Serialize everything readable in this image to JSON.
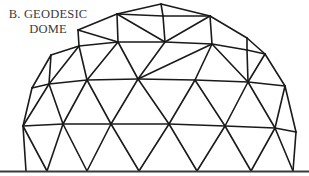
{
  "caption": {
    "line1": "B. GEODESIC",
    "line2": "DOME"
  },
  "diagram": {
    "subject": "geodesic dome",
    "stroke_color": "#1a1a1a",
    "ground_color": "#3a3a3a",
    "ground_y": 171,
    "nodes": {
      "T": [
        161,
        4
      ],
      "A1": [
        117,
        14
      ],
      "A2": [
        163,
        16
      ],
      "A3": [
        210,
        16
      ],
      "B1": [
        78,
        30
      ],
      "B2": [
        118,
        42
      ],
      "B3": [
        165,
        42
      ],
      "B4": [
        212,
        44
      ],
      "B5": [
        247,
        38
      ],
      "C1": [
        51,
        55
      ],
      "C2": [
        79,
        46
      ],
      "C3": [
        247,
        50
      ],
      "C4": [
        265,
        54
      ],
      "D1": [
        32,
        88
      ],
      "D2": [
        49,
        84
      ],
      "D3": [
        87,
        80
      ],
      "D4": [
        138,
        79
      ],
      "D5": [
        195,
        80
      ],
      "D6": [
        248,
        82
      ],
      "D7": [
        285,
        86
      ],
      "E1": [
        23,
        126
      ],
      "E2": [
        63,
        124
      ],
      "E3": [
        111,
        124
      ],
      "E4": [
        169,
        124
      ],
      "E5": [
        225,
        126
      ],
      "E6": [
        275,
        128
      ],
      "E7": [
        296,
        132
      ],
      "F1": [
        26,
        171
      ],
      "F2": [
        47,
        171
      ],
      "F3": [
        87,
        171
      ],
      "F4": [
        139,
        171
      ],
      "F5": [
        197,
        171
      ],
      "F6": [
        251,
        171
      ],
      "F7": [
        293,
        171
      ]
    },
    "edges": [
      [
        "A1",
        "T"
      ],
      [
        "T",
        "A3"
      ],
      [
        "A1",
        "A2"
      ],
      [
        "A2",
        "A3"
      ],
      [
        "T",
        "A2"
      ],
      [
        "B1",
        "A1"
      ],
      [
        "A1",
        "B2"
      ],
      [
        "A1",
        "B3"
      ],
      [
        "A2",
        "B3"
      ],
      [
        "A3",
        "B3"
      ],
      [
        "A3",
        "B4"
      ],
      [
        "A3",
        "B5"
      ],
      [
        "B5",
        "C4"
      ],
      [
        "B1",
        "B2"
      ],
      [
        "B2",
        "B3"
      ],
      [
        "B3",
        "B4"
      ],
      [
        "B4",
        "C3"
      ],
      [
        "C3",
        "C4"
      ],
      [
        "B1",
        "C2"
      ],
      [
        "C1",
        "C2"
      ],
      [
        "C2",
        "B2"
      ],
      [
        "C1",
        "D1"
      ],
      [
        "C1",
        "D2"
      ],
      [
        "C2",
        "D2"
      ],
      [
        "C2",
        "D3"
      ],
      [
        "B2",
        "D3"
      ],
      [
        "B2",
        "D4"
      ],
      [
        "B3",
        "D4"
      ],
      [
        "B4",
        "D4"
      ],
      [
        "B4",
        "D5"
      ],
      [
        "B4",
        "D6"
      ],
      [
        "C3",
        "D6"
      ],
      [
        "C4",
        "D6"
      ],
      [
        "B5",
        "C3"
      ],
      [
        "C4",
        "D7"
      ],
      [
        "D1",
        "D2"
      ],
      [
        "D2",
        "D3"
      ],
      [
        "D3",
        "D4"
      ],
      [
        "D4",
        "D5"
      ],
      [
        "D5",
        "D6"
      ],
      [
        "D6",
        "D7"
      ],
      [
        "D1",
        "E1"
      ],
      [
        "D2",
        "E1"
      ],
      [
        "D2",
        "E2"
      ],
      [
        "D3",
        "E2"
      ],
      [
        "D3",
        "E3"
      ],
      [
        "D4",
        "E3"
      ],
      [
        "D4",
        "E4"
      ],
      [
        "D5",
        "E4"
      ],
      [
        "D5",
        "E5"
      ],
      [
        "D6",
        "E5"
      ],
      [
        "D6",
        "E6"
      ],
      [
        "D7",
        "E6"
      ],
      [
        "D7",
        "E7"
      ],
      [
        "E1",
        "E2"
      ],
      [
        "E2",
        "E3"
      ],
      [
        "E3",
        "E4"
      ],
      [
        "E4",
        "E5"
      ],
      [
        "E5",
        "E6"
      ],
      [
        "E6",
        "E7"
      ],
      [
        "E1",
        "F1"
      ],
      [
        "E1",
        "F2"
      ],
      [
        "E2",
        "F2"
      ],
      [
        "E2",
        "F3"
      ],
      [
        "E3",
        "F3"
      ],
      [
        "E3",
        "F4"
      ],
      [
        "E4",
        "F4"
      ],
      [
        "E4",
        "F5"
      ],
      [
        "E5",
        "F5"
      ],
      [
        "E5",
        "F6"
      ],
      [
        "E6",
        "F6"
      ],
      [
        "E6",
        "F7"
      ],
      [
        "E7",
        "F7"
      ]
    ]
  }
}
